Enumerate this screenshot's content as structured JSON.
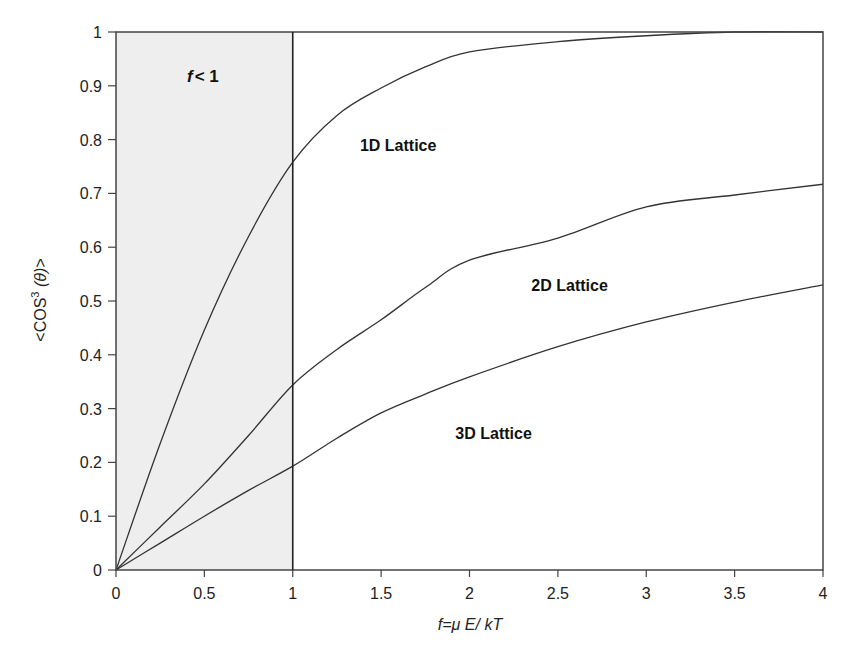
{
  "chart_data": {
    "type": "line",
    "title": "",
    "xlabel": "f=μ E/ kT",
    "xlabel_parts": {
      "f": "f",
      "eq": "=μ E/ ",
      "kT": "kT"
    },
    "ylabel": "<COS³ (θ)>",
    "ylabel_parts": {
      "pre": "<COS",
      "sup": "3",
      "post": " (θ)>"
    },
    "xlim": [
      0,
      4
    ],
    "ylim": [
      0,
      1
    ],
    "grid": false,
    "legend": "none (inline labels)",
    "x_ticks": [
      "0",
      "0.5",
      "1",
      "1.5",
      "2",
      "2.5",
      "3",
      "3.5",
      "4"
    ],
    "x_tick_values": [
      0,
      0.5,
      1,
      1.5,
      2,
      2.5,
      3,
      3.5,
      4
    ],
    "y_ticks": [
      "0",
      "0.1",
      "0.2",
      "0.3",
      "0.4",
      "0.5",
      "0.6",
      "0.7",
      "0.8",
      "0.9",
      "1"
    ],
    "y_tick_values": [
      0,
      0.1,
      0.2,
      0.3,
      0.4,
      0.5,
      0.6,
      0.7,
      0.8,
      0.9,
      1
    ],
    "shaded_region": {
      "x_from": 0,
      "x_to": 1,
      "label": "f < 1",
      "label_f": "f",
      "label_rest": "< 1",
      "color": "#eeeeee"
    },
    "vertical_line_x": 1,
    "x": [
      0,
      0.25,
      0.5,
      0.75,
      1,
      1.25,
      1.5,
      1.75,
      2,
      2.5,
      3,
      3.5,
      4
    ],
    "series": [
      {
        "name": "1D Lattice",
        "values": [
          0,
          0.235,
          0.446,
          0.62,
          0.758,
          0.845,
          0.896,
          0.935,
          0.963,
          0.982,
          0.993,
          1.0,
          1.0
        ],
        "label_pos": [
          1.38,
          0.79
        ]
      },
      {
        "name": "2D Lattice",
        "values": [
          0,
          0.08,
          0.16,
          0.25,
          0.344,
          0.41,
          0.465,
          0.525,
          0.576,
          0.617,
          0.675,
          0.697,
          0.717
        ],
        "label_pos": [
          2.35,
          0.53
        ]
      },
      {
        "name": "3D Lattice",
        "values": [
          0,
          0.05,
          0.1,
          0.148,
          0.193,
          0.245,
          0.292,
          0.327,
          0.359,
          0.415,
          0.461,
          0.498,
          0.53
        ],
        "label_pos": [
          1.92,
          0.255
        ]
      }
    ],
    "colors": {
      "line": "#333333",
      "axis": "#444444",
      "shade": "#eeeeee",
      "text": "#222222"
    }
  }
}
